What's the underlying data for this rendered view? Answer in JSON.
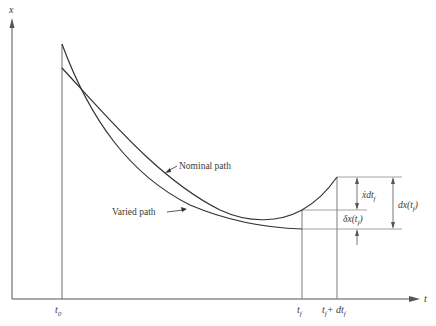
{
  "figure": {
    "axes": {
      "x_label": "t",
      "y_label": "x"
    },
    "time_ticks": {
      "t0": {
        "main": "t",
        "sub": "0"
      },
      "tf": {
        "main": "t",
        "sub": "f"
      },
      "tf_plus": {
        "main": "t",
        "sub": "f",
        "plus": "+ dt",
        "sub2": "f"
      }
    },
    "curves": {
      "nominal": {
        "label": "Nominal path"
      },
      "varied": {
        "label": "Varied path"
      }
    },
    "annotations": {
      "xdot_dt": {
        "main": "ẋdt",
        "sub": "f"
      },
      "delta_x": {
        "main": "δx(t",
        "sub": "f",
        "close": ")"
      },
      "dx": {
        "main": "dx(t",
        "sub": "f",
        "close": ")"
      }
    },
    "colors": {
      "line": "#3a3a3a",
      "guide": "#7a7a7a",
      "background": "#ffffff"
    }
  }
}
